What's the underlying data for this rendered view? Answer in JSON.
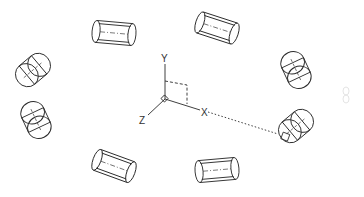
{
  "diagram": {
    "type": "cad-3d-array",
    "axes": {
      "x_label": "X",
      "y_label": "Y",
      "z_label": "Z"
    },
    "cylinder_count": 8,
    "line_color": "#2a2a2a",
    "background": "#ffffff"
  }
}
